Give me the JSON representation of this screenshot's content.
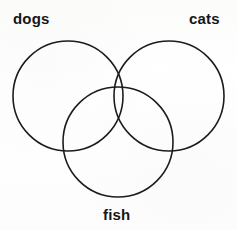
{
  "diagram": {
    "type": "venn-diagram",
    "set_count": 3,
    "background_color": "#fdfdfc",
    "stroke_color": "#1c1c1c",
    "label_color": "#161616",
    "sets": [
      {
        "id": "dogs",
        "label": "dogs",
        "position": "top-left",
        "circle": {
          "cx": 68,
          "cy": 96,
          "r": 55
        },
        "label_position": {
          "x": 13,
          "y": 11
        }
      },
      {
        "id": "cats",
        "label": "cats",
        "position": "top-right",
        "circle": {
          "cx": 169,
          "cy": 96,
          "r": 55
        },
        "label_position": {
          "x": 189,
          "y": 11
        }
      },
      {
        "id": "fish",
        "label": "fish",
        "position": "bottom-center",
        "circle": {
          "cx": 118,
          "cy": 142,
          "r": 55
        },
        "label_position": {
          "x": 103,
          "y": 207
        }
      }
    ]
  }
}
